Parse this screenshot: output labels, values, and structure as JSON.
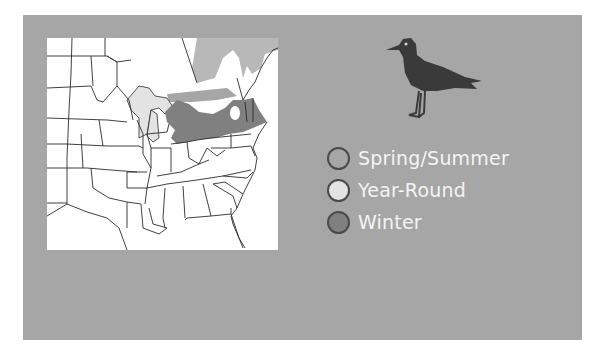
{
  "map": {
    "region": "Eastern United States",
    "colors": {
      "background_panel": "#a6a6a6",
      "map_land": "#ffffff",
      "state_lines": "#2b2b2b",
      "spring_summer": "#a6a6a6",
      "year_round": "#e3e3e3",
      "winter": "#808080"
    }
  },
  "bird": {
    "icon": "gull-silhouette-icon",
    "color": "#3a3a3a"
  },
  "legend": {
    "items": [
      {
        "label": "Spring/Summer",
        "color": "#a6a6a6"
      },
      {
        "label": "Year-Round",
        "color": "#e3e3e3"
      },
      {
        "label": "Winter",
        "color": "#808080"
      }
    ]
  }
}
